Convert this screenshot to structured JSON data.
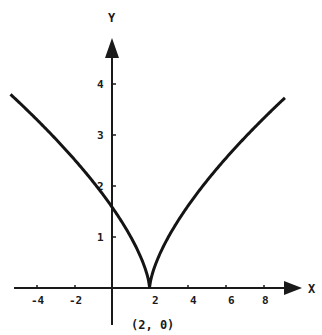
{
  "chart_data": {
    "type": "line",
    "title": "",
    "xlabel": "X",
    "ylabel": "Y",
    "function": "y = (x - 2)^(2/3)",
    "xlim": [
      -5.4,
      9.2
    ],
    "ylim": [
      0,
      4.5
    ],
    "grid": false,
    "x_ticks": [
      "-4",
      "-2",
      "2",
      "4",
      "6",
      "8"
    ],
    "y_ticks": [
      "1",
      "2",
      "3",
      "4"
    ],
    "annotation": "(2, 0)",
    "series": [
      {
        "name": "curve",
        "x": [
          -5.4,
          -4,
          -2,
          0,
          1,
          1.5,
          2,
          2.5,
          3,
          4,
          6,
          8,
          9.15
        ],
        "y": [
          3.8,
          3.3,
          2.52,
          1.59,
          1.0,
          0.63,
          0.0,
          0.63,
          1.0,
          1.59,
          2.52,
          3.3,
          3.71
        ]
      }
    ]
  }
}
